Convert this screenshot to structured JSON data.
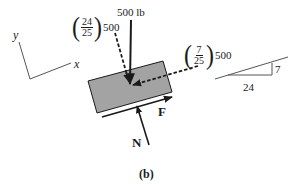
{
  "figure": {
    "caption": "(b)",
    "colors": {
      "ink": "#1a1a1a",
      "block_fill": "#a3a3a3",
      "slope_line": "#555555"
    }
  },
  "axes": {
    "x_label": "x",
    "y_label": "y"
  },
  "forces": {
    "weight": {
      "label": "500 lb"
    },
    "normal_component": {
      "num": "24",
      "den": "25",
      "coef": "500"
    },
    "parallel_component": {
      "num": "7",
      "den": "25",
      "coef": "500"
    },
    "friction": {
      "label": "F"
    },
    "normal": {
      "label": "N"
    }
  },
  "slope_triangle": {
    "rise": "7",
    "run": "24"
  }
}
